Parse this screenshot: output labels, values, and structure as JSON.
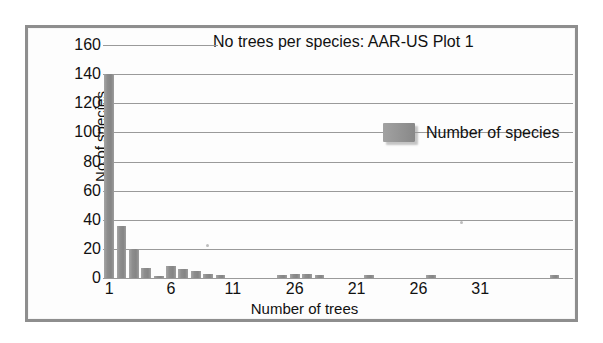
{
  "chart_data": {
    "type": "bar",
    "title": "No trees per species: AAR-US Plot 1",
    "xlabel": "Number of trees",
    "ylabel": "No of species",
    "ylim": [
      0,
      160
    ],
    "ytick_values": [
      160,
      140,
      120,
      100,
      80,
      60,
      40,
      20,
      0
    ],
    "xtick_labels": [
      "1",
      "6",
      "11",
      "26",
      "21",
      "26",
      "31"
    ],
    "xtick_positions": [
      1,
      6,
      11,
      16,
      21,
      26,
      31
    ],
    "grid": "horizontal",
    "legend_position": "inside-right",
    "series": [
      {
        "name": "Number of species",
        "color": "#8d8d8d",
        "categories": [
          1,
          2,
          3,
          4,
          5,
          6,
          7,
          8,
          9,
          10,
          11,
          12,
          13,
          14,
          15,
          16,
          17,
          18,
          19,
          20,
          21,
          22,
          23,
          24,
          25,
          26,
          27,
          28,
          29,
          30,
          31,
          32,
          33,
          34,
          35,
          36,
          37,
          38
        ],
        "values": [
          140,
          36,
          20,
          7,
          1,
          8,
          6,
          5,
          3,
          2,
          0,
          0,
          0,
          0,
          2,
          3,
          3,
          2,
          0,
          0,
          0,
          2,
          0,
          0,
          0,
          0,
          2,
          0,
          0,
          0,
          0,
          0,
          0,
          0,
          0,
          0,
          2,
          0
        ]
      }
    ]
  },
  "chart": {
    "title": "No trees per species: AAR-US Plot 1",
    "xaxis_title": "Number of trees",
    "yaxis_title": "No of species",
    "legend": {
      "label": "Number of species"
    }
  }
}
